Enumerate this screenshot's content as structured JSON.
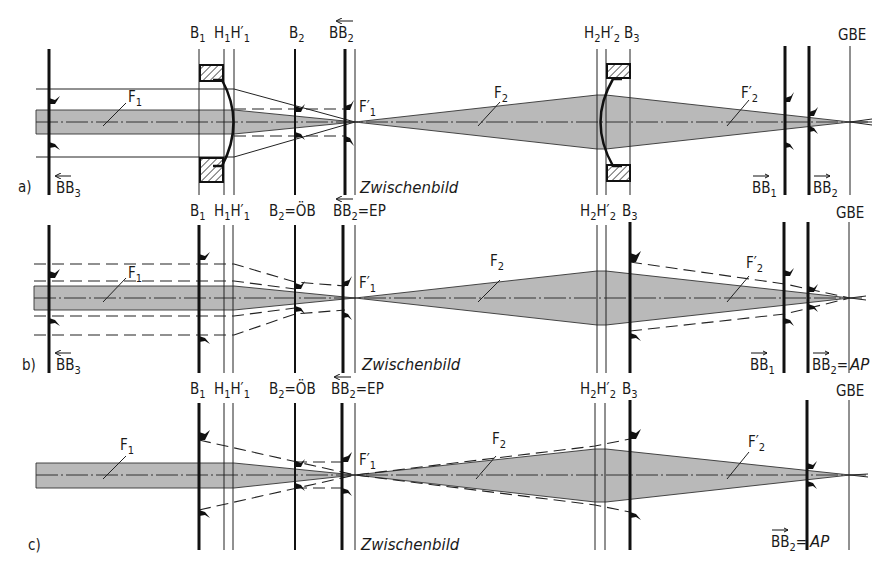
{
  "figure": {
    "panels": [
      {
        "id": "a",
        "label": "a)",
        "labels_top": {
          "B1": "B",
          "B1_sub": "1",
          "H1": "H",
          "H1_sub": "1",
          "H1p": "H′",
          "H1p_sub": "1",
          "B2": "B",
          "B2_sub": "2",
          "BB2": "BB",
          "BB2_sub": "2",
          "H2": "H",
          "H2_sub": "2",
          "H2p": "H′",
          "H2p_sub": "2",
          "B3": "B",
          "B3_sub": "3",
          "GBE": "GBE"
        },
        "labels_bottom": {
          "BB3": "BB",
          "BB3_sub": "3",
          "zwischenbild": "Zwischenbild",
          "BB1": "BB",
          "BB1_sub": "1",
          "BB2": "BB",
          "BB2_sub": "2"
        },
        "focus": {
          "F1": "F",
          "F1_sub": "1",
          "F1p": "F′",
          "F1p_sub": "1",
          "F2": "F",
          "F2_sub": "2",
          "F2p": "F′",
          "F2p_sub": "2"
        }
      },
      {
        "id": "b",
        "label": "b)",
        "labels_top": {
          "B1": "B",
          "B1_sub": "1",
          "H1": "H",
          "H1_sub": "1",
          "H1p": "H′",
          "H1p_sub": "1",
          "B2": "B",
          "B2_sub": "2",
          "B2_suffix": "=ÖB",
          "BB2": "BB",
          "BB2_sub": "2",
          "BB2_suffix": "=EP",
          "H2": "H",
          "H2_sub": "2",
          "H2p": "H′",
          "H2p_sub": "2",
          "B3": "B",
          "B3_sub": "3",
          "GBE": "GBE"
        },
        "labels_bottom": {
          "BB3": "BB",
          "BB3_sub": "3",
          "zwischenbild": "Zwischenbild",
          "BB1": "BB",
          "BB1_sub": "1",
          "BB2": "BB",
          "BB2_sub": "2",
          "BB2_suffix": "=",
          "AP": "AP"
        },
        "focus": {
          "F1": "F",
          "F1_sub": "1",
          "F1p": "F′",
          "F1p_sub": "1",
          "F2": "F",
          "F2_sub": "2",
          "F2p": "F′",
          "F2p_sub": "2"
        }
      },
      {
        "id": "c",
        "label": "c)",
        "labels_top": {
          "B1": "B",
          "B1_sub": "1",
          "H1": "H",
          "H1_sub": "1",
          "H1p": "H′",
          "H1p_sub": "1",
          "B2": "B",
          "B2_sub": "2",
          "B2_suffix": "=ÖB",
          "BB2": "BB",
          "BB2_sub": "2",
          "BB2_suffix": "=EP",
          "H2": "H",
          "H2_sub": "2",
          "H2p": "H′",
          "H2p_sub": "2",
          "B3": "B",
          "B3_sub": "3",
          "GBE": "GBE"
        },
        "labels_bottom": {
          "zwischenbild": "Zwischenbild",
          "BB2": "BB",
          "BB2_sub": "2",
          "BB2_suffix": "=",
          "AP": "AP"
        },
        "focus": {
          "F1": "F",
          "F1_sub": "1",
          "F1p": "F′",
          "F1p_sub": "1",
          "F2": "F",
          "F2_sub": "2",
          "F2p": "F′",
          "F2p_sub": "2"
        }
      }
    ],
    "colors": {
      "beam_fill": "#b9b9b9",
      "line": "#111111",
      "background": "#ffffff"
    }
  }
}
